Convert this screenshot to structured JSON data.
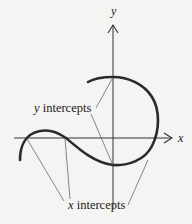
{
  "axes": {
    "x_label": "x",
    "y_label": "y"
  },
  "annotations": {
    "y_intercepts": {
      "var": "y",
      "text": " intercepts"
    },
    "x_intercepts": {
      "var": "x",
      "text": " intercepts"
    }
  },
  "colors": {
    "ink": "#2a2a2a",
    "background": "#f4f4f2"
  }
}
